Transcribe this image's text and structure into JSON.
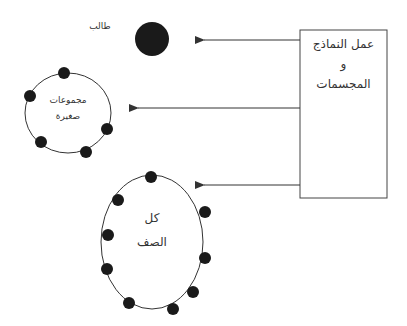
{
  "diagram": {
    "source_box": {
      "line1": "عمل النماذج",
      "line2": "و",
      "line3": "المجسمات"
    },
    "targets": [
      {
        "id": "student",
        "label": "طالب"
      },
      {
        "id": "small_groups",
        "label_line1": "مجموعات",
        "label_line2": "صغيرة"
      },
      {
        "id": "whole_class",
        "label_line1": "كل",
        "label_line2": "الصف"
      }
    ],
    "colors": {
      "stroke": "#333333",
      "dot": "#1a1a1a",
      "background": "#ffffff"
    }
  }
}
